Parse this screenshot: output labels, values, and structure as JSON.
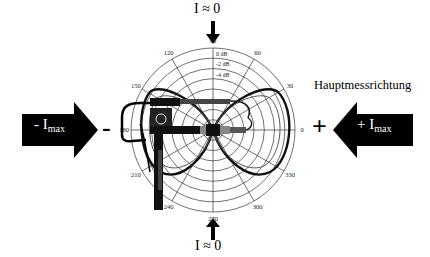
{
  "diagram": {
    "title": "Hauptmessrichtung",
    "top_label": {
      "text": "I ≈ 0"
    },
    "bottom_label": {
      "text": "I ≈ 0"
    },
    "left_arrow": {
      "prefix": "- I",
      "subscript": "max",
      "direction": "right",
      "color": "#000000"
    },
    "right_arrow": {
      "prefix": "+ I",
      "subscript": "max",
      "direction": "left",
      "color": "#000000"
    },
    "left_sign": "-",
    "right_sign": "+",
    "polar": {
      "angle_labels": [
        "0",
        "30",
        "60",
        "90",
        "120",
        "150",
        "180",
        "210",
        "240",
        "270",
        "300",
        "330"
      ],
      "db_labels": [
        "0 dB",
        "-2 dB",
        "-4 dB"
      ],
      "rings": 8,
      "pattern": "figure-eight (bidirectional) directivity"
    }
  },
  "chart_data": {
    "type": "polar",
    "title": "Hauptmessrichtung",
    "theta_ticks_deg": [
      0,
      30,
      60,
      90,
      120,
      150,
      180,
      210,
      240,
      270,
      300,
      330
    ],
    "radial_tick_labels": [
      "0 dB",
      "-2 dB",
      "-4 dB"
    ],
    "series": [
      {
        "name": "directivity",
        "shape": "figure-eight",
        "max_directions_deg": [
          0,
          180
        ],
        "null_directions_deg": [
          90,
          270
        ]
      }
    ],
    "annotations": [
      "I ≈ 0 (90°)",
      "I ≈ 0 (270°)",
      "+ I_max (0°)",
      "- I_max (180°)"
    ]
  }
}
